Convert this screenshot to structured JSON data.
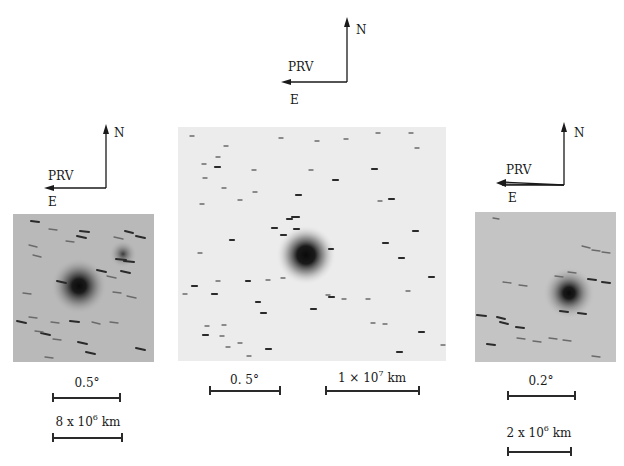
{
  "figure": {
    "panels": [
      {
        "id": "left",
        "compass": {
          "north": "N",
          "east": "E",
          "prv": "PRV"
        },
        "scale_bars": [
          {
            "label": "0.5°",
            "kind": "angular"
          },
          {
            "label_base": "8 x 10",
            "label_exp": "6",
            "label_unit": "km",
            "kind": "linear"
          }
        ]
      },
      {
        "id": "center",
        "compass": {
          "north": "N",
          "east": "E",
          "prv": "PRV"
        },
        "scale_bars": [
          {
            "label": "0. 5°",
            "kind": "angular"
          },
          {
            "label_base": "1 × 10",
            "label_exp": "7",
            "label_unit": "km",
            "kind": "linear"
          }
        ]
      },
      {
        "id": "right",
        "compass": {
          "north": "N",
          "east": "E",
          "prv": "PRV"
        },
        "scale_bars": [
          {
            "label": "0.2°",
            "kind": "angular"
          },
          {
            "label_base": "2 x 10",
            "label_exp": "6",
            "label_unit": "km",
            "kind": "linear"
          }
        ]
      }
    ],
    "colors": {
      "ink": "#1a1a1a",
      "left_panel_bg": "#b9b9b9",
      "center_panel_bg": "#ececec",
      "right_panel_bg": "#c4c4c4"
    }
  }
}
